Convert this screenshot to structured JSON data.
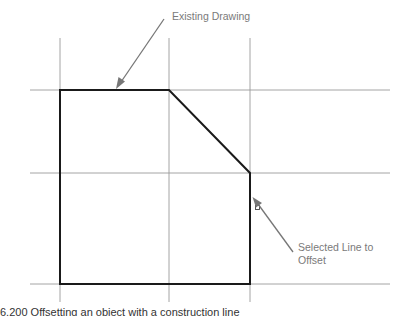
{
  "diagram": {
    "type": "cad-offset-illustration",
    "labels": {
      "existing_drawing": "Existing Drawing",
      "selected_line_line1": "Selected Line to",
      "selected_line_line2": "Offset"
    },
    "caption": "6.200   Offsetting an object with a construction line",
    "colors": {
      "object_line": "#1a1a1a",
      "construction_line": "#9a9a9a",
      "leader": "#777777",
      "label_text": "#7a7a7a"
    },
    "elements": {
      "construction_lines": {
        "horizontal_count": 3,
        "vertical_count": 3
      },
      "object_shape": "pentagon (rectangle with chamfered top-right corner)",
      "pickbox": "small square selection marker"
    }
  }
}
